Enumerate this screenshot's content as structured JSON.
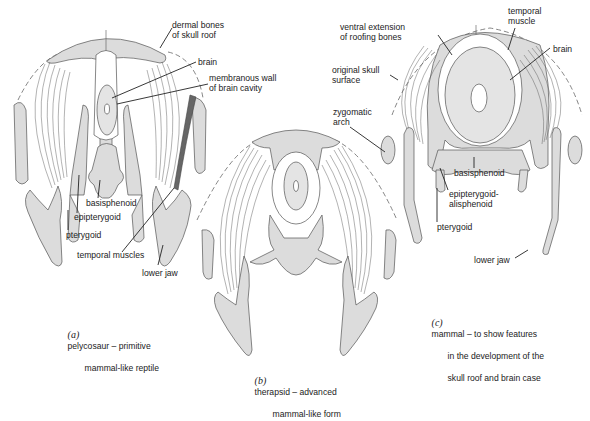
{
  "figure": {
    "panels": [
      {
        "id": "a",
        "caption_tag": "(a)",
        "caption_lines": [
          "pelycosaur – primitive",
          "mammal-like reptile"
        ],
        "labels": {
          "dermal_bones": "dermal bones\nof skull roof",
          "brain": "brain",
          "membranous_wall": "membranous wall\nof brain cavity",
          "basisphenoid": "basisphenoid",
          "epipterygoid": "epipterygoid",
          "pterygoid": "pterygoid",
          "temporal_muscles": "temporal muscles",
          "lower_jaw": "lower jaw"
        }
      },
      {
        "id": "b",
        "caption_tag": "(b)",
        "caption_lines": [
          "therapsid – advanced",
          "mammal-like form"
        ],
        "labels": {}
      },
      {
        "id": "c",
        "caption_tag": "(c)",
        "caption_lines": [
          "mammal – to show features",
          "in the development of the",
          "skull roof and brain case"
        ],
        "labels": {
          "ventral_extension": "ventral extension\nof roofing bones",
          "temporal_muscle": "temporal\nmuscle",
          "brain": "brain",
          "original_surface": "original skull\nsurface",
          "zygomatic_arch": "zygomatic\narch",
          "basisphenoid": "basisphenoid",
          "epipterygoid_alisphenoid": "epipterygoid-\nalisphenoid",
          "pterygoid": "pterygoid",
          "lower_jaw": "lower jaw"
        }
      }
    ],
    "colors": {
      "bone_fill": "#dcdcdc",
      "outline": "#555555",
      "muscle_band_dark": "#666666",
      "background": "#ffffff"
    }
  }
}
